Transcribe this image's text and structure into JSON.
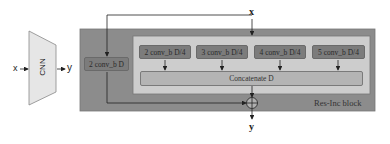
{
  "cnn_panel": {
    "input_label": "x",
    "block_label": "CNN",
    "output_label": "y"
  },
  "res_inc_block": {
    "input_label": "x",
    "output_label": "y",
    "block_title": "Res-Inc block",
    "shortcut_conv": "2 conv_b D",
    "branches": [
      {
        "label": "2 conv_b D/4"
      },
      {
        "label": "3 conv_b D/4"
      },
      {
        "label": "4 conv_b D/4"
      },
      {
        "label": "5 conv_b D/4"
      }
    ],
    "concat_label": "Concatenate D",
    "sum_symbol": "⊕"
  },
  "colors": {
    "outer_block": "#8c8c8c",
    "inner_block": "#cdcdcd",
    "conv_box": "#7c7c7c",
    "concat_box": "#b4b4b4",
    "cnn_trapezoid": "#e6e6e6"
  }
}
